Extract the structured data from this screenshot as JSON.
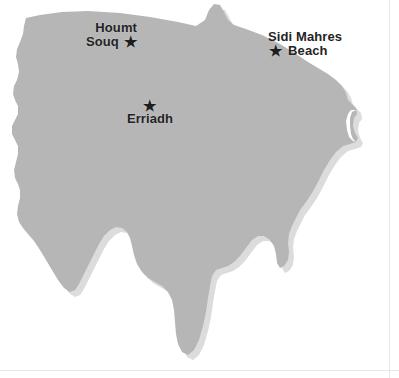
{
  "map": {
    "title": "Djerba island outline map",
    "colors": {
      "land_fill": "#b6b6b6",
      "land_shadow": "#d9d9d9",
      "sea_background": "#ffffff",
      "label_text": "#242424",
      "marker": "#1e1e1e",
      "page_rule": "#e8e8e8"
    },
    "star_glyph": "★",
    "markers": [
      {
        "id": "houmt-souq",
        "name": "Houmt Souq",
        "lines": [
          "Houmt",
          "Souq"
        ],
        "star_position": "right-of-second-line",
        "x": 141,
        "y": 38
      },
      {
        "id": "sidi-mahres-beach",
        "name": "Sidi Mahres Beach",
        "lines": [
          "Sidi Mahres",
          "Beach"
        ],
        "star_position": "left-of-second-line",
        "x": 276,
        "y": 52
      },
      {
        "id": "erriadh",
        "name": "Erriadh",
        "lines": [
          "Erriadh"
        ],
        "star_position": "above-label",
        "x": 148,
        "y": 107
      }
    ]
  }
}
